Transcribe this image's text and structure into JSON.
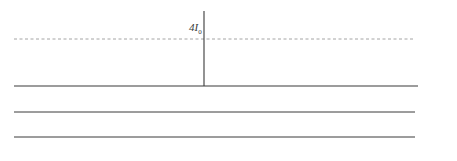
{
  "diagram": {
    "peak_label": "4I₀",
    "colors": {
      "curve": "#3a3a3a",
      "axis": "#3a3a3a",
      "dashed": "#9a9a9a"
    },
    "axes": [
      {
        "name": "y",
        "label": "y",
        "ticks": [
          "−3λR/d",
          "−2λR/d",
          "−λR/d",
          "0",
          "λR/d",
          "2λR/d",
          "3λR/d"
        ]
      },
      {
        "name": "phi",
        "label": "φ",
        "ticks": [
          "−6π",
          "−4π",
          "−2π",
          "0",
          "2π",
          "4π",
          "6π"
        ]
      },
      {
        "name": "d-sin-theta",
        "label": "d sin θ",
        "ticks": [
          "−3λ",
          "−2λ",
          "−1λ",
          "0",
          "1λ",
          "2λ",
          "3λ"
        ]
      }
    ]
  }
}
